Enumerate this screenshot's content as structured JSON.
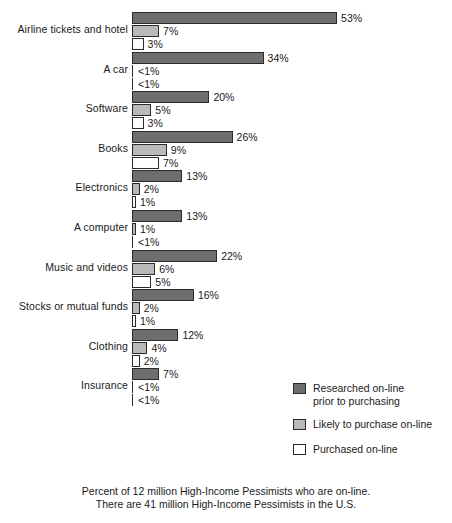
{
  "chart_data": {
    "type": "bar",
    "orientation": "horizontal",
    "title": "",
    "xlabel": "",
    "ylabel": "",
    "xlim": [
      0,
      53
    ],
    "grid": false,
    "legend_position": "bottom-right",
    "categories": [
      "Airline tickets and hotel",
      "A car",
      "Software",
      "Books",
      "Electronics",
      "A computer",
      "Music and videos",
      "Stocks or mutual funds",
      "Clothing",
      "Insurance"
    ],
    "series": [
      {
        "name": "Researched on-line prior to purchasing",
        "color": "#6e6e6e",
        "values": [
          53,
          34,
          20,
          26,
          13,
          13,
          22,
          16,
          12,
          7
        ],
        "labels": [
          "53%",
          "34%",
          "20%",
          "26%",
          "13%",
          "13%",
          "22%",
          "16%",
          "12%",
          "7%"
        ]
      },
      {
        "name": "Likely to purchase on-line",
        "color": "#b9b9b9",
        "values": [
          7,
          0,
          5,
          9,
          2,
          1,
          6,
          2,
          4,
          0
        ],
        "labels": [
          "7%",
          "<1%",
          "5%",
          "9%",
          "2%",
          "1%",
          "6%",
          "2%",
          "4%",
          "<1%"
        ]
      },
      {
        "name": "Purchased on-line",
        "color": "#ffffff",
        "values": [
          3,
          0,
          3,
          7,
          1,
          0,
          5,
          1,
          2,
          0
        ],
        "labels": [
          "3%",
          "<1%",
          "3%",
          "7%",
          "1%",
          "<1%",
          "5%",
          "1%",
          "2%",
          "<1%"
        ]
      }
    ],
    "annotations": [
      "Percent of 12 million High-Income Pessimists who are on-line.",
      "There are 41 million High-Income Pessimists in the U.S."
    ]
  },
  "legend": {
    "items": [
      {
        "label": "Researched on-line\nprior to purchasing",
        "swatch": "s0"
      },
      {
        "label": "Likely to purchase on-line",
        "swatch": "s1"
      },
      {
        "label": "Purchased on-line",
        "swatch": "s2"
      }
    ]
  },
  "footnote": {
    "line1": "Percent of 12 million High-Income Pessimists who are on-line.",
    "line2": "There are 41 million High-Income Pessimists in the U.S."
  }
}
